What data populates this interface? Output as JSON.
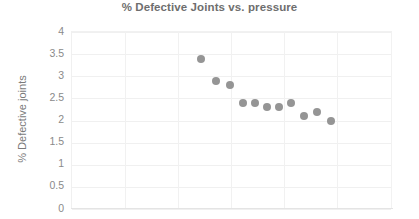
{
  "chart_data": {
    "type": "scatter",
    "title": "% Defective Joints vs. pressure",
    "xlabel": "",
    "ylabel": "% Defective joints",
    "ylim": [
      0,
      4
    ],
    "yticks": [
      "0",
      "0.5",
      "1",
      "1.5",
      "2",
      "2.5",
      "3",
      "3.5",
      "4"
    ],
    "ytick_values": [
      0,
      0.5,
      1,
      1.5,
      2,
      2.5,
      3,
      3.5,
      4
    ],
    "xticks": [],
    "xtick_labels": [],
    "grid": "horizontal-and-vertical",
    "legend": "none",
    "marker_color": "#8c8c8c",
    "marker_shape": "circle",
    "series": [
      {
        "name": "% Defective joints",
        "points": [
          {
            "x": 200,
            "y": 3.4
          },
          {
            "x": 215,
            "y": 2.9
          },
          {
            "x": 229,
            "y": 2.8
          },
          {
            "x": 242,
            "y": 2.4
          },
          {
            "x": 254,
            "y": 2.4
          },
          {
            "x": 266,
            "y": 2.3
          },
          {
            "x": 278,
            "y": 2.3
          },
          {
            "x": 290,
            "y": 2.4
          },
          {
            "x": 303,
            "y": 2.1
          },
          {
            "x": 316,
            "y": 2.2
          },
          {
            "x": 330,
            "y": 2.0
          }
        ]
      }
    ],
    "values": [
      3.4,
      2.9,
      2.8,
      2.4,
      2.4,
      2.3,
      2.3,
      2.4,
      2.1,
      2.2,
      2.0
    ]
  },
  "axis": {
    "y_label": "% Defective joints"
  },
  "header": {
    "title": "% Defective Joints vs. pressure"
  },
  "plot_geometry": {
    "left_px": 71,
    "top_px": 31,
    "width_px": 321,
    "height_px": 177,
    "vgrid_px": [
      53,
      106,
      159,
      212,
      265
    ],
    "x_domain_px": [
      71,
      392
    ]
  }
}
